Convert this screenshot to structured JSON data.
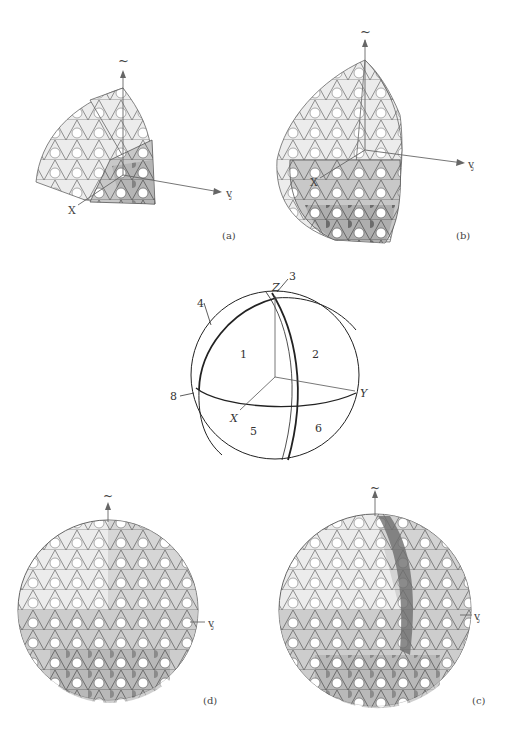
{
  "panels": {
    "a": {
      "label": "(a)",
      "axes": {
        "z": "~",
        "y": "ᶌ",
        "x": "X"
      }
    },
    "b": {
      "label": "(b)",
      "axes": {
        "z": "~",
        "y": "ᶌ",
        "x": "X"
      }
    },
    "center": {
      "axes": {
        "z": "Z",
        "y": "Y",
        "x": "X"
      },
      "regions": [
        "1",
        "2",
        "5",
        "6"
      ],
      "callouts": [
        "3",
        "4",
        "8"
      ]
    },
    "d": {
      "label": "(d)",
      "axes": {
        "z": "~",
        "y": "ᶌ"
      }
    },
    "c": {
      "label": "(c)",
      "axes": {
        "z": "~",
        "y": "ᶌ"
      }
    }
  },
  "colors": {
    "light": "#f2f2f2",
    "mid": "#cfcfcf",
    "dark": "#9a9a9a",
    "edge": "#555555",
    "hole": "#ffffff"
  }
}
